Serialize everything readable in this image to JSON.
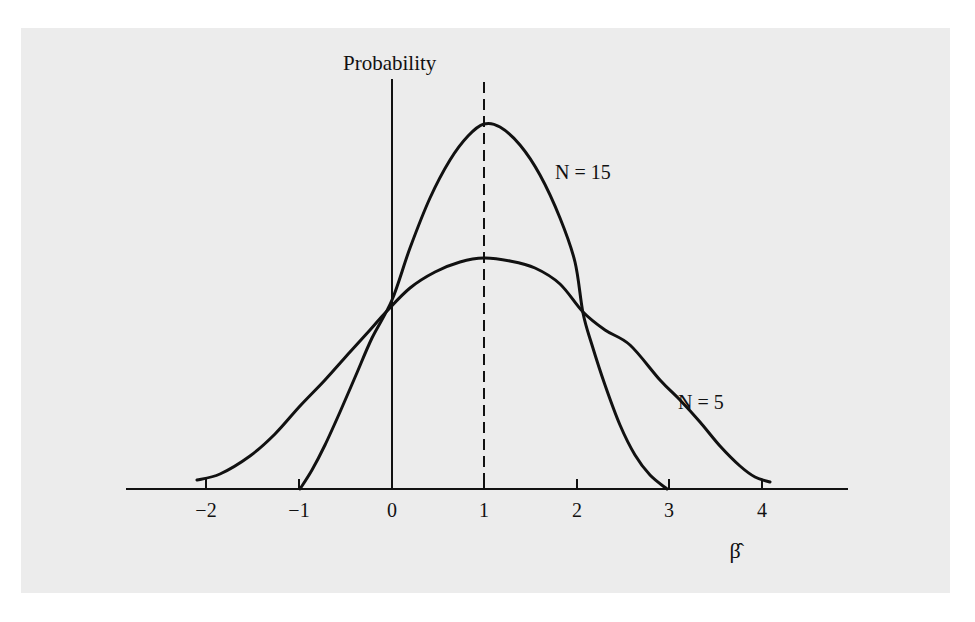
{
  "chart_data": {
    "type": "line",
    "title": "",
    "ylabel": "Probability",
    "xlabel": "β̂",
    "xlim": [
      -2.8,
      4.9
    ],
    "x_ticks": [
      "-2",
      "-1",
      "0",
      "1",
      "2",
      "3",
      "4"
    ],
    "x_tick_labels": [
      "−2",
      "−1",
      "0",
      "1",
      "2",
      "3",
      "4"
    ],
    "grid": false,
    "legend": "inline labels",
    "reference_line": {
      "x": 1,
      "style": "dashed",
      "meaning": "true value of beta"
    },
    "y_axis_at_x": 0,
    "series": [
      {
        "name": "N = 15",
        "description": "sampling distribution of beta-hat, sample size 15 (narrow, tall)",
        "points": [
          [
            -1.0,
            0.0
          ],
          [
            -0.8,
            0.1
          ],
          [
            -0.6,
            0.24
          ],
          [
            -0.4,
            0.4
          ],
          [
            -0.2,
            0.56
          ],
          [
            0.0,
            0.52
          ],
          [
            0.2,
            0.72
          ],
          [
            0.4,
            0.85
          ],
          [
            0.6,
            0.94
          ],
          [
            0.8,
            0.99
          ],
          [
            1.0,
            1.0
          ],
          [
            1.2,
            0.99
          ],
          [
            1.4,
            0.94
          ],
          [
            1.6,
            0.85
          ],
          [
            1.8,
            0.72
          ],
          [
            2.0,
            0.56
          ],
          [
            2.2,
            0.4
          ],
          [
            2.4,
            0.24
          ],
          [
            2.6,
            0.12
          ],
          [
            2.8,
            0.04
          ],
          [
            3.0,
            0.0
          ]
        ],
        "peak": {
          "x": 1,
          "relative_height": 1.0
        }
      },
      {
        "name": "N = 5",
        "description": "sampling distribution of beta-hat, sample size 5 (wide, flat)",
        "peak": {
          "x": 1,
          "relative_height": 0.63
        }
      }
    ]
  },
  "labels": {
    "y_axis": "Probability",
    "x_axis": "β̂",
    "series_n15": "N = 15",
    "series_n5": "N = 5",
    "ticks": [
      "−2",
      "−1",
      "0",
      "1",
      "2",
      "3",
      "4"
    ]
  },
  "plot_px": {
    "axis_y": 489,
    "axis_x_start": 126,
    "axis_x_end": 848,
    "y_axis_x": 392,
    "y_axis_top": 79,
    "dashed_x": 484,
    "dashed_top": 82,
    "tick_x": [
      206,
      299,
      392,
      484,
      577,
      669,
      762
    ],
    "tick_len": 10,
    "curve_n15": [
      [
        300,
        489
      ],
      [
        312,
        470
      ],
      [
        325,
        445
      ],
      [
        340,
        412
      ],
      [
        356,
        375
      ],
      [
        372,
        338
      ],
      [
        392,
        300
      ],
      [
        410,
        248
      ],
      [
        430,
        198
      ],
      [
        450,
        160
      ],
      [
        468,
        136
      ],
      [
        484,
        124
      ],
      [
        500,
        127
      ],
      [
        520,
        145
      ],
      [
        540,
        175
      ],
      [
        560,
        218
      ],
      [
        575,
        262
      ],
      [
        583,
        313
      ],
      [
        592,
        345
      ],
      [
        605,
        385
      ],
      [
        620,
        425
      ],
      [
        635,
        455
      ],
      [
        650,
        475
      ],
      [
        667,
        489
      ]
    ],
    "curve_n5": [
      [
        197,
        480
      ],
      [
        220,
        474
      ],
      [
        250,
        456
      ],
      [
        275,
        434
      ],
      [
        300,
        406
      ],
      [
        325,
        380
      ],
      [
        350,
        352
      ],
      [
        370,
        330
      ],
      [
        386,
        312
      ],
      [
        410,
        288
      ],
      [
        435,
        272
      ],
      [
        460,
        262
      ],
      [
        484,
        258
      ],
      [
        510,
        261
      ],
      [
        535,
        268
      ],
      [
        560,
        284
      ],
      [
        583,
        312
      ],
      [
        605,
        330
      ],
      [
        630,
        345
      ],
      [
        660,
        380
      ],
      [
        680,
        400
      ],
      [
        700,
        422
      ],
      [
        720,
        446
      ],
      [
        740,
        466
      ],
      [
        755,
        477
      ],
      [
        770,
        482
      ]
    ],
    "curve_color": "#111111",
    "curve_width": 3
  }
}
